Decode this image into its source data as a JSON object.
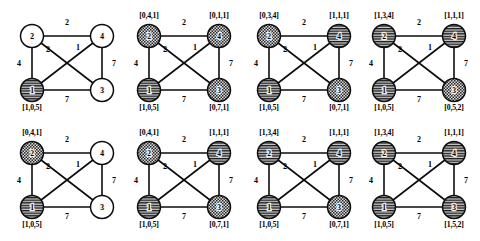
{
  "figure": {
    "node_ids": [
      "1",
      "2",
      "3",
      "4"
    ],
    "edges": [
      {
        "id": "e24",
        "from": "2",
        "to": "4",
        "weight": "2"
      },
      {
        "id": "e12",
        "from": "1",
        "to": "2",
        "weight": "4"
      },
      {
        "id": "e23",
        "from": "2",
        "to": "3",
        "weight": "2"
      },
      {
        "id": "e14",
        "from": "1",
        "to": "4",
        "weight": "1"
      },
      {
        "id": "e34",
        "from": "3",
        "to": "4",
        "weight": "7"
      },
      {
        "id": "e13",
        "from": "1",
        "to": "3",
        "weight": "7"
      }
    ],
    "fills": {
      "empty": "white",
      "striped": "horizontal-lines",
      "checkered": "checker-dots"
    }
  },
  "panels": [
    {
      "id": "panel-1",
      "nodes": {
        "n2": {
          "label": "2",
          "fill": "empty",
          "state": ""
        },
        "n4": {
          "label": "4",
          "fill": "empty",
          "state": ""
        },
        "n1": {
          "label": "1",
          "fill": "striped",
          "state": "[1,0,5]"
        },
        "n3": {
          "label": "3",
          "fill": "empty",
          "state": ""
        }
      }
    },
    {
      "id": "panel-2",
      "nodes": {
        "n2": {
          "label": "2",
          "fill": "checkered",
          "state": "[0,4,1]"
        },
        "n4": {
          "label": "4",
          "fill": "checkered",
          "state": "[0,1,1]"
        },
        "n1": {
          "label": "1",
          "fill": "striped",
          "state": "[1,0,5]"
        },
        "n3": {
          "label": "3",
          "fill": "checkered",
          "state": "[0,7,1]"
        }
      }
    },
    {
      "id": "panel-3",
      "nodes": {
        "n2": {
          "label": "2",
          "fill": "checkered",
          "state": "[0,3,4]"
        },
        "n4": {
          "label": "4",
          "fill": "striped",
          "state": "[1,1,1]"
        },
        "n1": {
          "label": "1",
          "fill": "striped",
          "state": "[1,0,5]"
        },
        "n3": {
          "label": "3",
          "fill": "checkered",
          "state": "[0,7,1]"
        }
      }
    },
    {
      "id": "panel-4",
      "nodes": {
        "n2": {
          "label": "2",
          "fill": "striped",
          "state": "[1,3,4]"
        },
        "n4": {
          "label": "4",
          "fill": "striped",
          "state": "[1,1,1]"
        },
        "n1": {
          "label": "1",
          "fill": "striped",
          "state": "[1,0,5]"
        },
        "n3": {
          "label": "3",
          "fill": "checkered",
          "state": "[0,5,2]"
        }
      }
    },
    {
      "id": "panel-5",
      "nodes": {
        "n2": {
          "label": "2",
          "fill": "checkered",
          "state": "[0,4,1]"
        },
        "n4": {
          "label": "4",
          "fill": "empty",
          "state": ""
        },
        "n1": {
          "label": "1",
          "fill": "striped",
          "state": "[1,0,5]"
        },
        "n3": {
          "label": "3",
          "fill": "empty",
          "state": ""
        }
      }
    },
    {
      "id": "panel-6",
      "nodes": {
        "n2": {
          "label": "2",
          "fill": "checkered",
          "state": "[0,4,1]"
        },
        "n4": {
          "label": "4",
          "fill": "striped",
          "state": "[1,1,1]"
        },
        "n1": {
          "label": "1",
          "fill": "striped",
          "state": "[1,0,5]"
        },
        "n3": {
          "label": "3",
          "fill": "checkered",
          "state": "[0,7,1]"
        }
      }
    },
    {
      "id": "panel-7",
      "nodes": {
        "n2": {
          "label": "2",
          "fill": "striped",
          "state": "[1,3,4]"
        },
        "n4": {
          "label": "4",
          "fill": "striped",
          "state": "[1,1,1]"
        },
        "n1": {
          "label": "1",
          "fill": "striped",
          "state": "[1,0,5]"
        },
        "n3": {
          "label": "3",
          "fill": "checkered",
          "state": "[0,7,1]"
        }
      }
    },
    {
      "id": "panel-8",
      "nodes": {
        "n2": {
          "label": "2",
          "fill": "striped",
          "state": "[1,3,4]"
        },
        "n4": {
          "label": "4",
          "fill": "striped",
          "state": "[1,1,1]"
        },
        "n1": {
          "label": "1",
          "fill": "striped",
          "state": "[1,0,5]"
        },
        "n3": {
          "label": "3",
          "fill": "striped",
          "state": "[1,5,2]"
        }
      }
    }
  ]
}
